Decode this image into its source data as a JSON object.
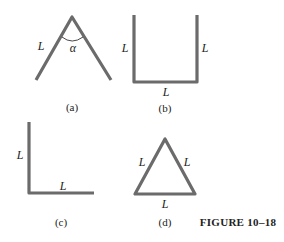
{
  "figure": {
    "title": "FIGURE 10–18",
    "rod_color": "#6b6b6b",
    "panels": [
      {
        "id": "a",
        "caption": "(a)",
        "shape": "inverted-V",
        "labels": [
          "L"
        ],
        "angle_label": "α"
      },
      {
        "id": "b",
        "caption": "(b)",
        "shape": "U",
        "labels": [
          "L",
          "L",
          "L"
        ]
      },
      {
        "id": "c",
        "caption": "(c)",
        "shape": "L-shape",
        "labels": [
          "L",
          "L"
        ]
      },
      {
        "id": "d",
        "caption": "(d)",
        "shape": "triangle",
        "labels": [
          "L",
          "L",
          "L"
        ]
      }
    ]
  }
}
